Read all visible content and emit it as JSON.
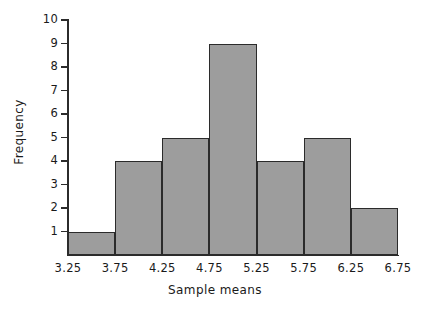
{
  "chart_data": {
    "type": "bar",
    "title": "",
    "xlabel": "Sample means",
    "ylabel": "Frequency",
    "categories": [
      "3.25-3.75",
      "3.75-4.25",
      "4.25-4.75",
      "4.75-5.25",
      "5.25-5.75",
      "5.75-6.25",
      "6.25-6.75"
    ],
    "values": [
      1,
      4,
      5,
      9,
      4,
      5,
      2
    ],
    "bin_edges": [
      3.25,
      3.75,
      4.25,
      4.75,
      5.25,
      5.75,
      6.25,
      6.75
    ],
    "x_tick_labels": [
      "3.25",
      "3.75",
      "4.25",
      "4.75",
      "5.25",
      "5.75",
      "6.25",
      "6.75"
    ],
    "y_tick_labels": [
      "1",
      "2",
      "3",
      "4",
      "5",
      "6",
      "7",
      "8",
      "9",
      "10"
    ],
    "y_tick_values": [
      1,
      2,
      3,
      4,
      5,
      6,
      7,
      8,
      9,
      10
    ],
    "ylim": [
      0,
      10
    ],
    "xlim": [
      3.25,
      6.75
    ],
    "grid": false,
    "legend": null,
    "bar_fill_color": "#9d9d9d",
    "bar_edge_color": "#2b2b2b",
    "background_color": "#ffffff",
    "axis_color": "#2b2b2b"
  }
}
